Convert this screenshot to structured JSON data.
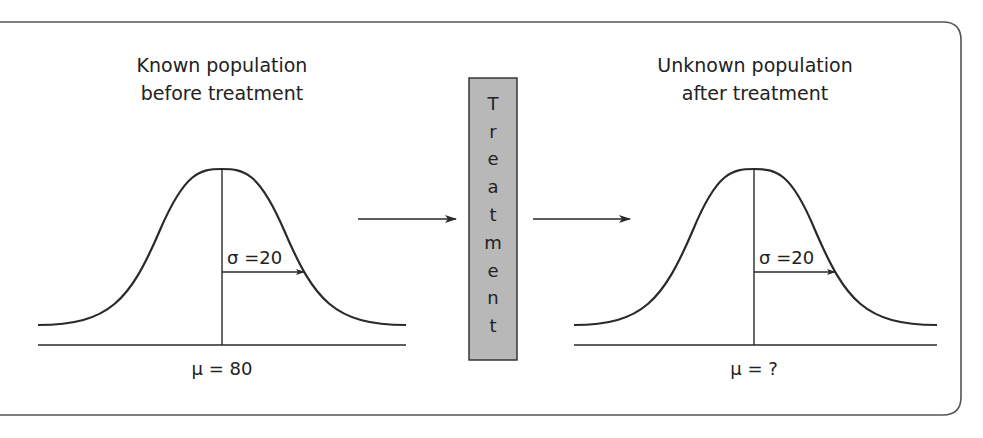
{
  "diagram": {
    "left_panel": {
      "title_line1": "Known population",
      "title_line2": "before treatment",
      "sigma_label": "σ =20",
      "mu_label": "μ = 80"
    },
    "treatment_box": {
      "letters": [
        "T",
        "r",
        "e",
        "a",
        "t",
        "m",
        "e",
        "n",
        "t"
      ],
      "word": "Treatment",
      "fill": "#b8b8b8"
    },
    "right_panel": {
      "title_line1": "Unknown population",
      "title_line2": "after treatment",
      "sigma_label": "σ =20",
      "mu_label": "μ = ?"
    },
    "colors": {
      "line": "#2a2a2a",
      "frame": "#555555",
      "box_fill": "#b8b8b8",
      "background": "#ffffff"
    }
  }
}
